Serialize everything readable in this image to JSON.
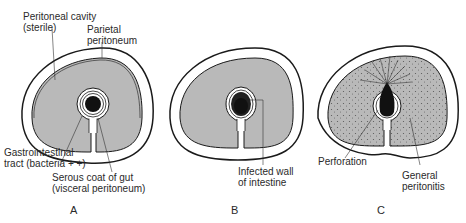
{
  "figure": {
    "panels": [
      {
        "id": "A",
        "label": "A",
        "annotations": {
          "cavity_line1": "Peritoneal cavity",
          "cavity_line2": "(sterile)",
          "parietal_line1": "Parietal",
          "parietal_line2": "peritoneum",
          "gi_line1": "Gastrointestinal",
          "gi_line2": "tract (bacteria + +)",
          "serous_line1": "Serous coat of gut",
          "serous_line2": "(visceral peritoneum)"
        }
      },
      {
        "id": "B",
        "label": "B",
        "annotations": {
          "infected_line1": "Infected wall",
          "infected_line2": "of intestine"
        }
      },
      {
        "id": "C",
        "label": "C",
        "annotations": {
          "perforation": "Perforation",
          "general_line1": "General",
          "general_line2": "peritonitis"
        }
      }
    ],
    "colors": {
      "cavity_fill": "#b9b9b9",
      "outline": "#1a1a1a",
      "gut_lumen": "#111111",
      "background": "#ffffff"
    }
  }
}
